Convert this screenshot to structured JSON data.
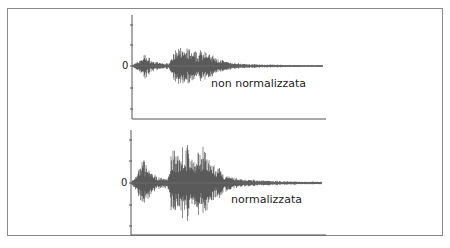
{
  "chart_data": [
    {
      "type": "line",
      "title": "",
      "label": "non normalizzata",
      "zero_label": "0",
      "xlabel": "",
      "ylabel": "",
      "description": "Audio waveform, lower amplitude (not normalized)",
      "envelope_x": [
        0,
        4,
        8,
        12,
        16,
        20,
        24,
        28,
        32,
        36,
        40,
        44,
        48,
        52,
        56,
        60,
        64,
        68,
        72,
        76,
        80,
        84,
        88,
        92,
        96,
        100,
        110,
        120,
        130,
        140,
        150,
        170,
        190,
        210,
        230
      ],
      "envelope_amp": [
        0.05,
        0.15,
        0.35,
        0.55,
        0.35,
        0.2,
        0.15,
        0.12,
        0.1,
        0.12,
        0.7,
        0.65,
        0.85,
        0.75,
        0.8,
        0.6,
        0.55,
        0.7,
        0.9,
        0.5,
        0.45,
        0.3,
        0.3,
        0.2,
        0.15,
        0.12,
        0.08,
        0.06,
        0.05,
        0.04,
        0.03,
        0.02,
        0.02,
        0.01,
        0.01
      ],
      "scale": 0.5
    },
    {
      "type": "line",
      "title": "",
      "label": "normalizzata",
      "zero_label": "0",
      "xlabel": "",
      "ylabel": "",
      "description": "Audio waveform, normalized (higher amplitude)",
      "envelope_x": [
        0,
        4,
        8,
        12,
        16,
        20,
        24,
        28,
        32,
        36,
        40,
        44,
        48,
        52,
        56,
        60,
        64,
        68,
        72,
        76,
        80,
        84,
        88,
        92,
        96,
        100,
        110,
        120,
        130,
        140,
        150,
        170,
        190,
        210,
        230
      ],
      "envelope_amp": [
        0.05,
        0.15,
        0.35,
        0.55,
        0.35,
        0.2,
        0.15,
        0.12,
        0.1,
        0.12,
        0.7,
        0.65,
        0.85,
        0.75,
        0.8,
        0.6,
        0.55,
        0.7,
        0.9,
        0.5,
        0.45,
        0.3,
        0.3,
        0.2,
        0.15,
        0.12,
        0.08,
        0.06,
        0.05,
        0.04,
        0.03,
        0.02,
        0.02,
        0.01,
        0.01
      ],
      "scale": 1.0
    }
  ],
  "panels": {
    "top": {
      "label": "non normalizzata",
      "zero": "0"
    },
    "bottom": {
      "label": "normalizzata",
      "zero": "0"
    }
  }
}
